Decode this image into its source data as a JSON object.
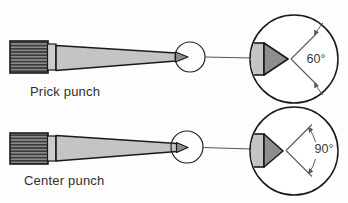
{
  "diagram": {
    "type": "tool-illustration",
    "punches": [
      {
        "id": "prick-punch",
        "label": "Prick punch",
        "point_angle": "60°"
      },
      {
        "id": "center-punch",
        "label": "Center punch",
        "point_angle": "90°"
      }
    ],
    "colors": {
      "background": "#fdfdfd",
      "outline": "#1a1a1a",
      "taper_fill": "#c4c4c4",
      "ferrule_fill": "#cccccc",
      "tip_fill": "#8e8e8e",
      "knurl_light": "#8a8a8a",
      "knurl_dark": "#3a3a3a",
      "dimension_line": "#5a5a5a",
      "label_text": "#2f2f2f"
    }
  }
}
